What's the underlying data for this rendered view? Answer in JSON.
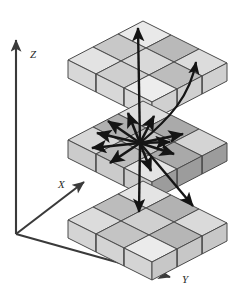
{
  "figure": {
    "name": "3d-voxel-neighborhood-diagram",
    "background": "#ffffff",
    "width": 245,
    "height": 299,
    "ink_color": "#3a3a3a",
    "arrow_color": "#151515"
  },
  "axes": {
    "origin": {
      "x": 16,
      "y": 234
    },
    "z": {
      "label": "Z",
      "label_x": 30,
      "label_y": 58,
      "tip_x": 16,
      "tip_y": 40
    },
    "x": {
      "label": "X",
      "label_x": 58,
      "label_y": 188,
      "tip_x": 84,
      "tip_y": 182
    },
    "y": {
      "label": "Y",
      "label_x": 182,
      "label_y": 283,
      "tip_x": 170,
      "tip_y": 277
    }
  },
  "layers": [
    {
      "name": "top-layer",
      "index": 2,
      "z_label": "k+1",
      "origin_x": 143,
      "origin_y": 21,
      "grid": 3,
      "shades": [
        [
          "#e9e9e9",
          "#c8c8c8",
          "#e3e3e3"
        ],
        [
          "#b9b9b9",
          "#d9d9d9",
          "#cfcfcf"
        ],
        [
          "#dcdcdc",
          "#bdbdbd",
          "#ededed"
        ]
      ],
      "side_shade": "#d2d2d2",
      "front_shade": "#e6e6e6"
    },
    {
      "name": "middle-layer",
      "index": 1,
      "z_label": "k",
      "origin_x": 143,
      "origin_y": 101,
      "grid": 3,
      "shades": [
        [
          "#dedede",
          "#b0b0b0",
          "#d7d7d7"
        ],
        [
          "#aaaaaa",
          "#c6c6c6",
          "#bdbdbd"
        ],
        [
          "#d4d4d4",
          "#a9a9a9",
          "#e4e4e4"
        ]
      ],
      "side_shade": "#9e9e9e",
      "front_shade": "#d8d8d8"
    },
    {
      "name": "bottom-layer",
      "index": 0,
      "z_label": "k-1",
      "origin_x": 143,
      "origin_y": 181,
      "grid": 3,
      "shades": [
        [
          "#e4e4e4",
          "#bcbcbc",
          "#dcdcdc"
        ],
        [
          "#b2b2b2",
          "#d0d0d0",
          "#c4c4c4"
        ],
        [
          "#dadada",
          "#b6b6b6",
          "#ebebeb"
        ]
      ],
      "side_shade": "#c9c9c9",
      "front_shade": "#e2e2e2"
    }
  ],
  "center_voxel": {
    "x": 140,
    "y": 143,
    "layer": "middle-layer"
  },
  "neighbor_arrows": {
    "count": 26,
    "description": "arrows from center voxel to 26-neighborhood",
    "in_plane": [
      {
        "name": "arrow-west",
        "dx": -43,
        "dy": -10
      },
      {
        "name": "arrow-northwest",
        "dx": -32,
        "dy": -22
      },
      {
        "name": "arrow-north",
        "dx": -12,
        "dy": -30
      },
      {
        "name": "arrow-northeast",
        "dx": 14,
        "dy": -27
      },
      {
        "name": "arrow-east",
        "dx": 43,
        "dy": -9
      },
      {
        "name": "arrow-southeast",
        "dx": 34,
        "dy": 11
      },
      {
        "name": "arrow-south",
        "dx": 11,
        "dy": 28
      },
      {
        "name": "arrow-southwest",
        "dx": -30,
        "dy": 20
      },
      {
        "name": "arrow-west-far",
        "dx": -48,
        "dy": 5
      },
      {
        "name": "arrow-east-near",
        "dx": 30,
        "dy": -1
      }
    ],
    "upward": [
      {
        "name": "arrow-up-vertical",
        "x2": 138,
        "y2": 28
      },
      {
        "name": "arrow-up-curved",
        "x2": 196,
        "y2": 62
      }
    ],
    "downward": [
      {
        "name": "arrow-down-vertical",
        "x2": 139,
        "y2": 212
      },
      {
        "name": "arrow-down-right",
        "x2": 193,
        "y2": 206
      }
    ]
  },
  "geometry": {
    "cell_dx_x": 28,
    "cell_dx_y": 14,
    "cell_dy_x": -25,
    "cell_dy_y": 13,
    "cube_height": 18
  }
}
